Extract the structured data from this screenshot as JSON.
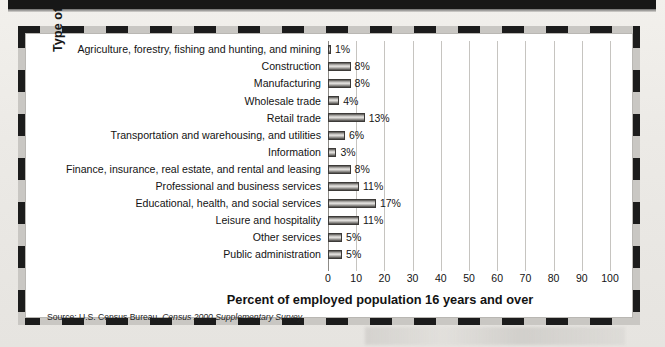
{
  "chart_data": {
    "type": "bar",
    "orientation": "horizontal",
    "title": "",
    "xlabel": "Percent of employed population 16 years and over",
    "ylabel": "Type of Industry",
    "xlim": [
      0,
      100
    ],
    "xticks": [
      0,
      10,
      20,
      30,
      40,
      50,
      60,
      70,
      80,
      90,
      100
    ],
    "xtick_labels": [
      "0",
      "10",
      "20",
      "30",
      "40",
      "50",
      "60",
      "70",
      "80",
      "90",
      "100"
    ],
    "grid": true,
    "legend": "none",
    "value_suffix": "%",
    "categories": [
      "Agriculture, forestry, fishing and hunting, and mining",
      "Construction",
      "Manufacturing",
      "Wholesale trade",
      "Retail trade",
      "Transportation and warehousing, and utilities",
      "Information",
      "Finance, insurance, real estate, and rental and leasing",
      "Professional and business services",
      "Educational, health, and social services",
      "Leisure and hospitality",
      "Other services",
      "Public administration"
    ],
    "values": [
      1,
      8,
      8,
      4,
      13,
      6,
      3,
      8,
      11,
      17,
      11,
      5,
      5
    ],
    "data_labels": [
      "1%",
      "8%",
      "8%",
      "4%",
      "13%",
      "6%",
      "3%",
      "8%",
      "11%",
      "17%",
      "11%",
      "5%",
      "5%"
    ]
  },
  "source": {
    "prefix": "Source: U.S. Census Bureau, ",
    "italic": "Census 2000 Supplementary Survey."
  },
  "colors": {
    "bar_fill_light": "#e4e2df",
    "bar_fill_dark": "#4a4845",
    "bar_outline": "#3c3a38",
    "gridline": "#c6c4c0",
    "axis": "#8d8b87",
    "text": "#131313",
    "frame_dash_dark": "#1c1c1c",
    "frame_dash_light": "#c9c7c3",
    "plate": "#ffffff",
    "page": "#eceae6"
  }
}
